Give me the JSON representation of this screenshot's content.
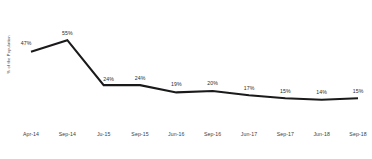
{
  "chart_data": {
    "type": "line",
    "title": "",
    "xlabel": "",
    "ylabel": "% of the Population",
    "categories": [
      "Apr-14",
      "Sep-14",
      "Ju-15",
      "Sep-15",
      "Jun-16",
      "Sep-16",
      "Jun-17",
      "Sep-17",
      "Jun-18",
      "Sep-18"
    ],
    "values": [
      47,
      55,
      24,
      24,
      19,
      20,
      17,
      15,
      14,
      15
    ],
    "data_labels": [
      "47%",
      "55%",
      "24%",
      "24%",
      "19%",
      "20%",
      "17%",
      "15%",
      "14%",
      "15%"
    ],
    "ylim": [
      0,
      62
    ],
    "grid": false,
    "legend": "none",
    "series": [
      {
        "name": "% of the Population",
        "values": [
          47,
          55,
          24,
          24,
          19,
          20,
          17,
          15,
          14,
          15
        ],
        "color": "#1a1a1a"
      }
    ]
  },
  "style": {
    "line_color": "#1a1a1a",
    "background": "#ffffff",
    "text_color": "#3d3d3d"
  }
}
